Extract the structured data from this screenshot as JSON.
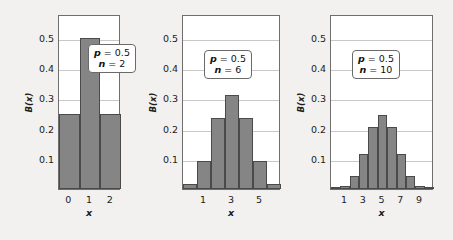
{
  "figure": {
    "background_color": "#f2f1ef",
    "bar_fill_color": "#858585",
    "bar_edge_color": "#4a4a4a",
    "grid_color": "#c9c8c6",
    "frame_color": "#6e6e6e"
  },
  "panels": [
    {
      "id": "panel-n2",
      "ylabel": "B(x)",
      "xlabel": "x",
      "yticks": [
        "0.1",
        "0.2",
        "0.3",
        "0.4",
        "0.5"
      ],
      "xticks": [
        "0",
        "1",
        "2"
      ],
      "param_p_label": "p",
      "param_p_eq": "= 0.5",
      "param_n_label": "n",
      "param_n_eq": "= 2"
    },
    {
      "id": "panel-n6",
      "ylabel": "B(x)",
      "xlabel": "x",
      "yticks": [
        "0.1",
        "0.2",
        "0.3",
        "0.4",
        "0.5"
      ],
      "xticks": [
        "1",
        "3",
        "5"
      ],
      "param_p_label": "p",
      "param_p_eq": "= 0.5",
      "param_n_label": "n",
      "param_n_eq": "= 6"
    },
    {
      "id": "panel-n10",
      "ylabel": "B(x)",
      "xlabel": "x",
      "yticks": [
        "0.1",
        "0.2",
        "0.3",
        "0.4",
        "0.5"
      ],
      "xticks": [
        "1",
        "3",
        "5",
        "7",
        "9"
      ],
      "param_p_label": "p",
      "param_p_eq": "= 0.5",
      "param_n_label": "n",
      "param_n_eq": "= 10"
    }
  ],
  "chart_data": [
    {
      "type": "bar",
      "title": "",
      "xlabel": "x",
      "ylabel": "B(x)",
      "categories": [
        "0",
        "1",
        "2"
      ],
      "values": [
        0.25,
        0.5,
        0.25
      ],
      "ylim": [
        0,
        0.58
      ],
      "yticks": [
        0.1,
        0.2,
        0.3,
        0.4,
        0.5
      ],
      "xticks_shown": [
        "0",
        "1",
        "2"
      ],
      "grid": "horizontal",
      "legend": "none",
      "annotations": [
        "p = 0.5",
        "n = 2"
      ],
      "parameters": {
        "p": 0.5,
        "n": 2
      }
    },
    {
      "type": "bar",
      "title": "",
      "xlabel": "x",
      "ylabel": "B(x)",
      "categories": [
        "0",
        "1",
        "2",
        "3",
        "4",
        "5",
        "6"
      ],
      "values": [
        0.0156,
        0.0938,
        0.2344,
        0.3125,
        0.2344,
        0.0938,
        0.0156
      ],
      "ylim": [
        0,
        0.58
      ],
      "yticks": [
        0.1,
        0.2,
        0.3,
        0.4,
        0.5
      ],
      "xticks_shown": [
        "1",
        "3",
        "5"
      ],
      "grid": "horizontal",
      "legend": "none",
      "annotations": [
        "p = 0.5",
        "n = 6"
      ],
      "parameters": {
        "p": 0.5,
        "n": 6
      }
    },
    {
      "type": "bar",
      "title": "",
      "xlabel": "x",
      "ylabel": "B(x)",
      "categories": [
        "0",
        "1",
        "2",
        "3",
        "4",
        "5",
        "6",
        "7",
        "8",
        "9",
        "10"
      ],
      "values": [
        0.001,
        0.0098,
        0.0439,
        0.1172,
        0.2051,
        0.2461,
        0.2051,
        0.1172,
        0.0439,
        0.0098,
        0.001
      ],
      "ylim": [
        0,
        0.58
      ],
      "yticks": [
        0.1,
        0.2,
        0.3,
        0.4,
        0.5
      ],
      "xticks_shown": [
        "1",
        "3",
        "5",
        "7",
        "9"
      ],
      "grid": "horizontal",
      "legend": "none",
      "annotations": [
        "p = 0.5",
        "n = 10"
      ],
      "parameters": {
        "p": 0.5,
        "n": 10
      }
    }
  ]
}
